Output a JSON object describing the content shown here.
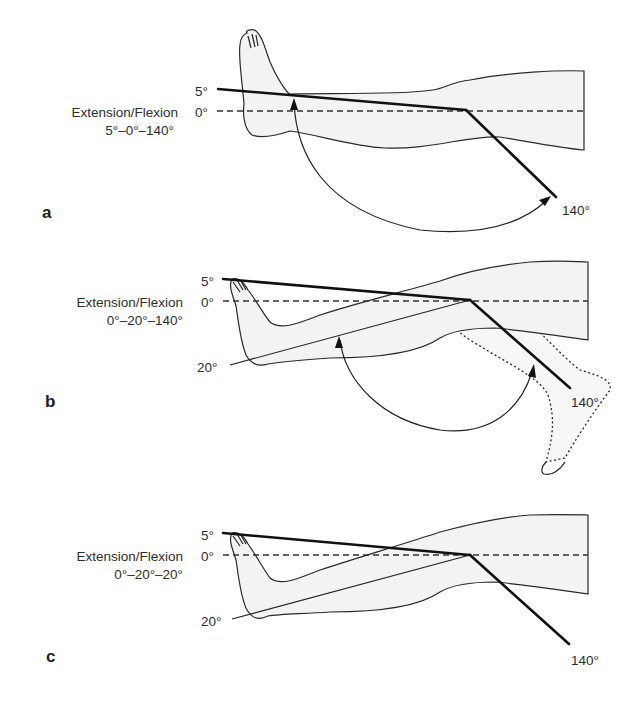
{
  "figure": {
    "panels": [
      {
        "id": "a",
        "letter": "a",
        "title": "Extension/Flexion",
        "notation": "5°–0°–140°",
        "angle_labels": {
          "top": "5°",
          "zero": "0°",
          "flexion": "140°"
        }
      },
      {
        "id": "b",
        "letter": "b",
        "title": "Extension/Flexion",
        "notation": "0°–20°–140°",
        "angle_labels": {
          "top": "5°",
          "zero": "0°",
          "contracture": "20°",
          "flexion": "140°"
        }
      },
      {
        "id": "c",
        "letter": "c",
        "title": "Extension/Flexion",
        "notation": "0°–20°–20°",
        "angle_labels": {
          "top": "5°",
          "zero": "0°",
          "contracture": "20°",
          "flexion": "140°"
        }
      }
    ]
  },
  "colors": {
    "background": "#ffffff",
    "leg_fill": "#f3f3f3",
    "line": "#111111",
    "text": "#2e2e2e"
  }
}
